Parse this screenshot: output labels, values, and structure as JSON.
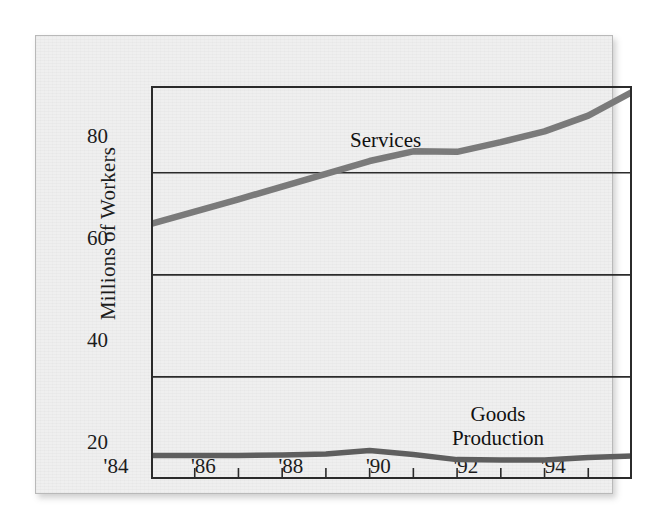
{
  "figure": {
    "background_color": "#efefef",
    "frame_color": "#2b2b2b",
    "line_color": "#7a7a7a",
    "text_color": "#1c1c1c"
  },
  "chart_data": {
    "type": "line",
    "title": "",
    "subtitle": "",
    "xlabel": "",
    "ylabel": "Millions of Workers",
    "xlim": [
      1984,
      1995
    ],
    "ylim": [
      20,
      97
    ],
    "grid": true,
    "gridlines_y": [
      40,
      60,
      80
    ],
    "legend_position": "inline-annotations",
    "y_ticks": [
      20,
      40,
      60,
      80
    ],
    "y_tick_labels": [
      "20",
      "40",
      "60",
      "80"
    ],
    "x": [
      1984,
      1985,
      1986,
      1987,
      1988,
      1989,
      1990,
      1991,
      1992,
      1993,
      1994,
      1995
    ],
    "x_tick_labels": [
      "'84",
      "",
      "'86",
      "",
      "'88",
      "",
      "'90",
      "",
      "'92",
      "",
      "'94",
      ""
    ],
    "x_major_labels": [
      "'84",
      "'86",
      "'88",
      "'90",
      "'92",
      "'94"
    ],
    "x_major_years": [
      1984,
      1986,
      1988,
      1990,
      1992,
      1994
    ],
    "series": [
      {
        "name": "Services",
        "label_text": "Services",
        "color": "#7a7a7a",
        "values": [
          70.0,
          72.4,
          74.8,
          77.3,
          79.8,
          82.3,
          84.2,
          84.1,
          86.0,
          88.1,
          91.2,
          95.8
        ]
      },
      {
        "name": "Goods Production",
        "label_text_line1": "Goods",
        "label_text_line2": "Production",
        "color": "#5e5e5e",
        "values": [
          24.6,
          24.6,
          24.6,
          24.7,
          24.9,
          25.6,
          24.8,
          23.8,
          23.7,
          23.7,
          24.2,
          24.5
        ]
      }
    ]
  }
}
